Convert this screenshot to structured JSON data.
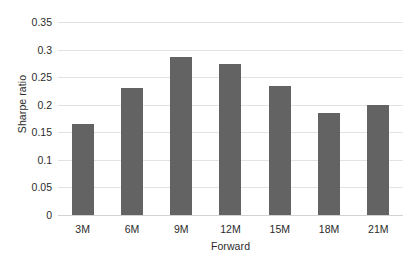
{
  "chart_data": {
    "type": "bar",
    "title": "",
    "subtitle": "",
    "xlabel": "Forward",
    "ylabel": "Sharpe ratio",
    "categories": [
      "3M",
      "6M",
      "9M",
      "12M",
      "15M",
      "18M",
      "21M"
    ],
    "values": [
      0.165,
      0.23,
      0.287,
      0.274,
      0.234,
      0.185,
      0.2
    ],
    "ylim": [
      0,
      0.35
    ],
    "ytick_labels": [
      "0.35",
      "0.3",
      "0.25",
      "0.2",
      "0.15",
      "0.1",
      "0.05",
      "0"
    ],
    "ytick_values": [
      0.35,
      0.3,
      0.25,
      0.2,
      0.15,
      0.1,
      0.05,
      0
    ],
    "grid": "horizontal",
    "legend": "none",
    "annotations": [],
    "bar_color": "#636363",
    "grid_color": "#e3e3e3",
    "axis_color": "#d2d2d2",
    "text_color": "#2b2b2b",
    "background": "#ffffff"
  }
}
